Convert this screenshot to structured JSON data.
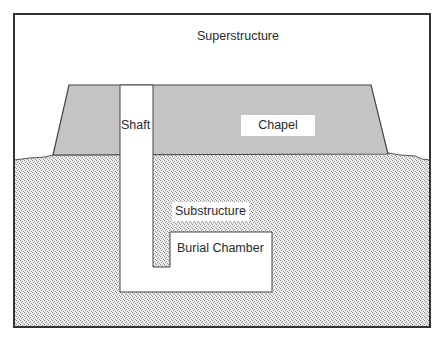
{
  "diagram": {
    "type": "cross-section",
    "labels": {
      "superstructure": "Superstructure",
      "shaft": "Shaft",
      "chapel": "Chapel",
      "substructure": "Substructure",
      "burial_chamber": "Burial Chamber"
    },
    "colors": {
      "frame": "#333333",
      "superstructure_fill": "#c4c4c4",
      "ground_fill": "#e6e6e6",
      "ground_stipple": "#8a8a8a",
      "void_fill": "#ffffff",
      "outline": "#444444"
    }
  }
}
